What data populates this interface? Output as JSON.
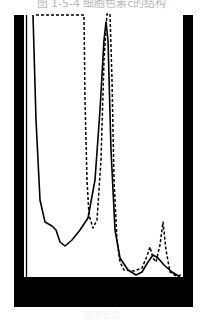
{
  "figure": {
    "caption": "图 1-5-4  细胞色素c的结构",
    "footnote": "吸收光谱"
  },
  "chart_data": {
    "type": "line",
    "title": "图 1-5-4  细胞色素c的结构",
    "xlabel": "",
    "ylabel": "",
    "grid": false,
    "legend": null,
    "colors": {
      "frame": "#000000",
      "series": "#000000",
      "background": "#ffffff"
    },
    "series": [
      {
        "name": "solid",
        "style": "solid",
        "points": [
          [
            33,
            15
          ],
          [
            36,
            120
          ],
          [
            40,
            200
          ],
          [
            45,
            222
          ],
          [
            52,
            226
          ],
          [
            56,
            230
          ],
          [
            60,
            242
          ],
          [
            65,
            246
          ],
          [
            72,
            240
          ],
          [
            80,
            230
          ],
          [
            88,
            218
          ],
          [
            95,
            180
          ],
          [
            100,
            110
          ],
          [
            104,
            40
          ],
          [
            106,
            22
          ],
          [
            108,
            40
          ],
          [
            111,
            150
          ],
          [
            115,
            230
          ],
          [
            120,
            258
          ],
          [
            128,
            270
          ],
          [
            136,
            275
          ],
          [
            142,
            272
          ],
          [
            148,
            262
          ],
          [
            153,
            255
          ],
          [
            158,
            258
          ],
          [
            164,
            265
          ],
          [
            172,
            272
          ],
          [
            180,
            277
          ]
        ]
      },
      {
        "name": "dashed",
        "style": "dashed",
        "points": [
          [
            36,
            15
          ],
          [
            84,
            15
          ],
          [
            85,
            100
          ],
          [
            87,
            180
          ],
          [
            89,
            215
          ],
          [
            93,
            228
          ],
          [
            97,
            220
          ],
          [
            101,
            160
          ],
          [
            104,
            60
          ],
          [
            107,
            14
          ],
          [
            110,
            14
          ],
          [
            112,
            80
          ],
          [
            114,
            180
          ],
          [
            117,
            240
          ],
          [
            120,
            262
          ],
          [
            124,
            270
          ],
          [
            134,
            271
          ],
          [
            142,
            268
          ],
          [
            147,
            256
          ],
          [
            150,
            247
          ],
          [
            153,
            258
          ],
          [
            156,
            262
          ],
          [
            160,
            245
          ],
          [
            163,
            222
          ],
          [
            166,
            250
          ],
          [
            170,
            272
          ],
          [
            176,
            276
          ],
          [
            181,
            275
          ]
        ]
      }
    ],
    "xlim": [
      26,
      183
    ],
    "ylim": [
      12,
      277
    ]
  }
}
